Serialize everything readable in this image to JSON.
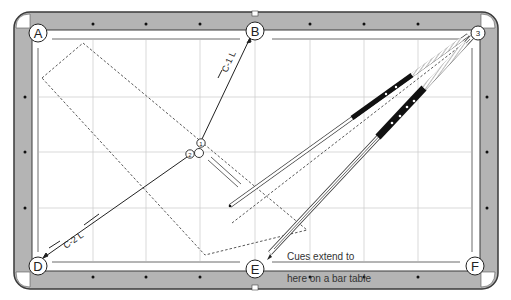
{
  "diagram": {
    "type": "pool-table-shot-diagram",
    "colors": {
      "rail": "#b4b4b4",
      "rail_border": "#3a3a3a",
      "cloth": "#ffffff",
      "grid": "#cfcfcf",
      "ink": "#222222"
    },
    "pockets": [
      {
        "id": "A",
        "label": "A",
        "x": 38,
        "y": 33
      },
      {
        "id": "B",
        "label": "B",
        "x": 255,
        "y": 31
      },
      {
        "id": "C",
        "label": "3",
        "x": 478,
        "y": 33
      },
      {
        "id": "D",
        "label": "D",
        "x": 38,
        "y": 266
      },
      {
        "id": "E",
        "label": "E",
        "x": 255,
        "y": 269
      },
      {
        "id": "F",
        "label": "F",
        "x": 475,
        "y": 266
      }
    ],
    "balls": [
      {
        "id": "ball-1",
        "label": "1",
        "x": 201,
        "y": 143
      },
      {
        "id": "ball-2",
        "label": "2",
        "x": 190,
        "y": 154
      },
      {
        "id": "cue-ball",
        "label": "",
        "x": 200,
        "y": 153
      }
    ],
    "shot_labels": [
      {
        "id": "c1l",
        "text": "C-1 L"
      },
      {
        "id": "c2l",
        "text": "C-2 L"
      }
    ],
    "note": {
      "line1": "Cues extend to",
      "line2": "here on a bar table"
    }
  }
}
